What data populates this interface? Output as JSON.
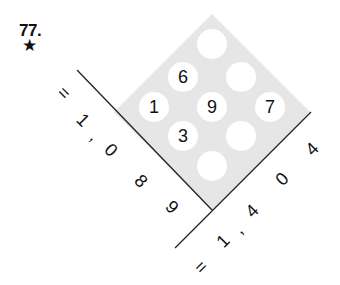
{
  "problem": {
    "number": "77.",
    "difficulty_icon": "★"
  },
  "grid": {
    "colors": {
      "diamond_fill": "#e6e6e6",
      "circle_fill": "#ffffff",
      "line": "#222222"
    },
    "cells": [
      {
        "pos": "top",
        "value": ""
      },
      {
        "pos": "upper-left",
        "value": "6"
      },
      {
        "pos": "upper-right",
        "value": ""
      },
      {
        "pos": "left",
        "value": "1"
      },
      {
        "pos": "center",
        "value": "9"
      },
      {
        "pos": "right",
        "value": "7"
      },
      {
        "pos": "lower-left",
        "value": "3"
      },
      {
        "pos": "lower-right",
        "value": ""
      },
      {
        "pos": "bottom",
        "value": ""
      }
    ]
  },
  "sums": {
    "left": {
      "chars": [
        "=",
        "1",
        ",",
        "0",
        "8",
        "9"
      ],
      "value": "1,089"
    },
    "right": {
      "chars": [
        "=",
        "1",
        ",",
        "4",
        "0",
        "4"
      ],
      "value": "1,404"
    }
  }
}
